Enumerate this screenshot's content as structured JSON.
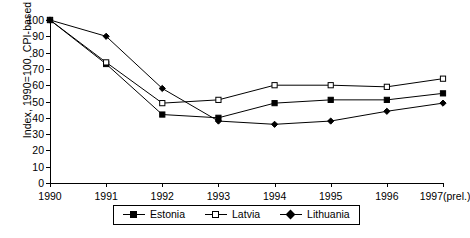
{
  "chart_data": {
    "type": "line",
    "title": "",
    "subtitle": "",
    "xlabel": "",
    "ylabel": "Index, 1990=100, CPI-based",
    "categories": [
      "1990",
      "1991",
      "1992",
      "1993",
      "1994",
      "1995",
      "1996",
      "1997(prel.)"
    ],
    "xtick_labels": [
      "1990",
      "1991",
      "1992",
      "1993",
      "1994",
      "1995",
      "1996",
      "1997(prel.)"
    ],
    "ytick_labels": [
      "0",
      "10",
      "20",
      "30",
      "40",
      "50",
      "60",
      "70",
      "80",
      "90",
      "100"
    ],
    "ylim": [
      0,
      100
    ],
    "ytick_step": 10,
    "grid": false,
    "legend_position": "bottom",
    "series": [
      {
        "name": "Estonia",
        "marker": "filled-square",
        "color": "#000000",
        "values": [
          100,
          73,
          42,
          40,
          49,
          51,
          51,
          55
        ]
      },
      {
        "name": "Latvia",
        "marker": "open-square",
        "color": "#000000",
        "values": [
          100,
          74,
          49,
          51,
          60,
          60,
          59,
          64
        ]
      },
      {
        "name": "Lithuania",
        "marker": "filled-diamond",
        "color": "#000000",
        "values": [
          100,
          90,
          58,
          38,
          36,
          38,
          44,
          49
        ]
      }
    ]
  },
  "legend": {
    "entries": [
      {
        "label": "Estonia",
        "marker": "filled-square"
      },
      {
        "label": "Latvia",
        "marker": "open-square"
      },
      {
        "label": "Lithuania",
        "marker": "filled-diamond"
      }
    ]
  }
}
